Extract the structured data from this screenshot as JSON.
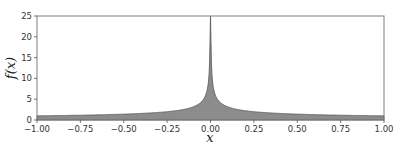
{
  "chart_data": {
    "type": "area",
    "title": "",
    "xlabel": "x",
    "ylabel": "f(x)",
    "function": "f(x) = 1/sqrt(|x|)",
    "xlim": [
      -1.0,
      1.0
    ],
    "ylim": [
      0,
      25
    ],
    "grid": false,
    "legend": null,
    "x_ticks": [
      -1.0,
      -0.75,
      -0.5,
      -0.25,
      0.0,
      0.25,
      0.5,
      0.75,
      1.0
    ],
    "x_tick_labels": [
      "−1.00",
      "−0.75",
      "−0.50",
      "−0.25",
      "0.00",
      "0.25",
      "0.50",
      "0.75",
      "1.00"
    ],
    "y_ticks": [
      0,
      5,
      10,
      15,
      20,
      25
    ],
    "y_tick_labels": [
      "0",
      "5",
      "10",
      "15",
      "20",
      "25"
    ],
    "series": [
      {
        "name": "f(x)",
        "x": [
          -1.0,
          -0.75,
          -0.5,
          -0.25,
          -0.1,
          -0.05,
          -0.01,
          -0.0016,
          0.0,
          0.0016,
          0.01,
          0.05,
          0.1,
          0.25,
          0.5,
          0.75,
          1.0
        ],
        "values": [
          1.0,
          1.15,
          1.41,
          2.0,
          3.16,
          4.47,
          10.0,
          25.0,
          25.0,
          25.0,
          10.0,
          4.47,
          3.16,
          2.0,
          1.41,
          1.15,
          1.0
        ],
        "fill_color": "#8c8c8c",
        "line_color": "#555555"
      }
    ],
    "colors": {
      "fill": "#8c8c8c",
      "edge": "#5a5a5a",
      "axes": "#7f7f7f"
    }
  }
}
